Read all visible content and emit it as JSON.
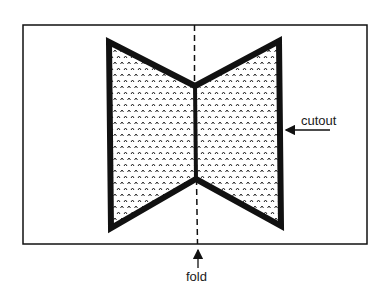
{
  "diagram": {
    "labels": {
      "cutout": "cutout",
      "fold": "fold"
    },
    "colors": {
      "stroke": "#111111",
      "background": "#ffffff",
      "stipple": "#222222"
    },
    "paper": {
      "x1": 23,
      "y1": 25,
      "x2": 367,
      "y2": 244
    },
    "fold_line": {
      "x": 195,
      "y_top": 25,
      "y_bottom": 244,
      "style": "dashed"
    },
    "cutout_shape": {
      "vertices": [
        [
          109,
          42
        ],
        [
          195,
          86
        ],
        [
          279,
          41
        ],
        [
          281,
          226
        ],
        [
          196,
          179
        ],
        [
          111,
          228
        ]
      ],
      "fill": "stipple-caret-pattern",
      "stroke_width": 6
    },
    "arrows": [
      {
        "name": "cutout-arrow",
        "from": [
          330,
          130
        ],
        "to": [
          284,
          130
        ]
      },
      {
        "name": "fold-arrow",
        "from": [
          198,
          268
        ],
        "to": [
          198,
          248
        ]
      }
    ]
  }
}
